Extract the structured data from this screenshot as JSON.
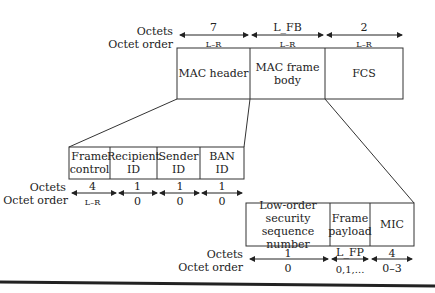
{
  "labels": {
    "octets": "Octets",
    "octet_order": "Octet order"
  },
  "top_frame": {
    "fields": [
      {
        "name": "MAC header",
        "octets": "7",
        "order": "L–R"
      },
      {
        "name": "MAC frame\nbody",
        "octets": "L_FB",
        "order": "L–R"
      },
      {
        "name": "FCS",
        "octets": "2",
        "order": "L–R"
      }
    ]
  },
  "header_frame": {
    "fields": [
      {
        "name": "Frame\ncontrol",
        "octets": "4",
        "order": "L–R"
      },
      {
        "name": "Recipient\nID",
        "octets": "1",
        "order": "0"
      },
      {
        "name": "Sender\nID",
        "octets": "1",
        "order": "0"
      },
      {
        "name": "BAN\nID",
        "octets": "1",
        "order": "0"
      }
    ]
  },
  "body_frame": {
    "fields": [
      {
        "name": "Low-order\nsecurity sequence\nnumber",
        "octets": "1",
        "order": "0"
      },
      {
        "name": "Frame\npayload",
        "octets": "L_FP",
        "order": "0,1,..."
      },
      {
        "name": "MIC",
        "octets": "4",
        "order": "0–3"
      }
    ]
  }
}
